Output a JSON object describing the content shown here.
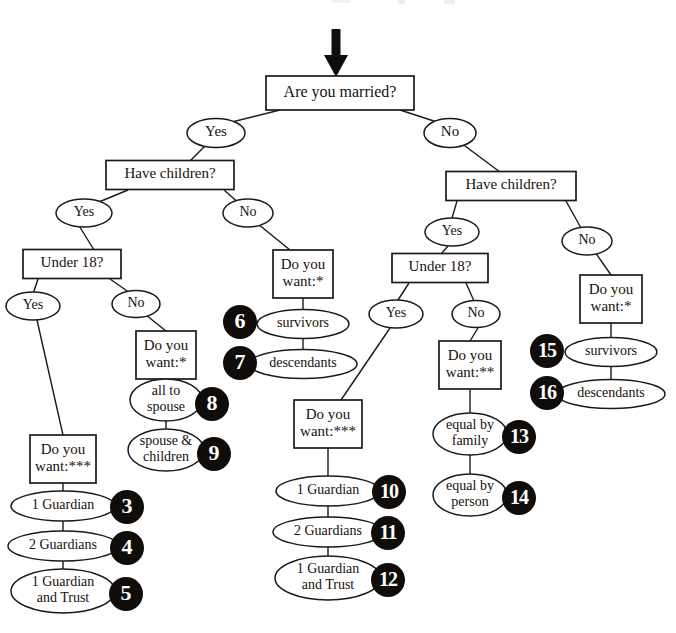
{
  "figure": {
    "type": "decision-tree-flowchart",
    "colors": {
      "line": "#1a1a1a",
      "text": "#17110d",
      "badge_fill": "#100c0a",
      "badge_text": "#ffffff",
      "node_fill": "#ffffff",
      "background": "#ffffff"
    },
    "entry_arrow": {
      "name": "entry-arrow",
      "points_to": "Are you married?"
    }
  },
  "nodes": [
    {
      "id": "root",
      "label": "Are you married?",
      "shape": "box",
      "x": 340,
      "y": 93,
      "w": 148,
      "h": 34,
      "font": 16
    },
    {
      "id": "m_yes",
      "label": "Yes",
      "shape": "ellipse",
      "x": 216,
      "y": 133,
      "w": 58,
      "h": 29,
      "font": 15
    },
    {
      "id": "m_no",
      "label": "No",
      "shape": "ellipse",
      "x": 450,
      "y": 133,
      "w": 52,
      "h": 29,
      "font": 15
    },
    {
      "id": "m_children",
      "label": "Have children?",
      "shape": "box",
      "x": 170,
      "y": 175,
      "w": 128,
      "h": 29,
      "font": 15
    },
    {
      "id": "mc_yes",
      "label": "Yes",
      "shape": "ellipse",
      "x": 84,
      "y": 213,
      "w": 56,
      "h": 28,
      "font": 14
    },
    {
      "id": "mc_no",
      "label": "No",
      "shape": "ellipse",
      "x": 248,
      "y": 213,
      "w": 50,
      "h": 28,
      "font": 14
    },
    {
      "id": "m_under18",
      "label": "Under 18?",
      "shape": "box",
      "x": 72,
      "y": 264,
      "w": 98,
      "h": 29,
      "font": 15
    },
    {
      "id": "mu_yes",
      "label": "Yes",
      "shape": "ellipse",
      "x": 33,
      "y": 306,
      "w": 54,
      "h": 28,
      "font": 14
    },
    {
      "id": "mu_no",
      "label": "No",
      "shape": "ellipse",
      "x": 136,
      "y": 304,
      "w": 48,
      "h": 27,
      "font": 14
    },
    {
      "id": "m_want1",
      "label": "Do you\nwant:*",
      "shape": "box",
      "x": 166,
      "y": 355,
      "w": 60,
      "h": 48,
      "font": 15
    },
    {
      "id": "all_to_spouse",
      "label": "all to\nspouse",
      "shape": "ellipse",
      "x": 166,
      "y": 400,
      "w": 72,
      "h": 42,
      "font": 14
    },
    {
      "id": "spouse_children",
      "label": "spouse &\nchildren",
      "shape": "ellipse",
      "x": 166,
      "y": 450,
      "w": 76,
      "h": 42,
      "font": 14
    },
    {
      "id": "m_want3",
      "label": "Do you\nwant:***",
      "shape": "box",
      "x": 63,
      "y": 459,
      "w": 66,
      "h": 48,
      "font": 15
    },
    {
      "id": "g1",
      "label": "1 Guardian",
      "shape": "ellipse",
      "x": 63,
      "y": 506,
      "w": 104,
      "h": 30,
      "font": 14
    },
    {
      "id": "g2",
      "label": "2 Guardians",
      "shape": "ellipse",
      "x": 63,
      "y": 546,
      "w": 110,
      "h": 30,
      "font": 14
    },
    {
      "id": "g3",
      "label": "1 Guardian\nand Trust",
      "shape": "ellipse",
      "x": 63,
      "y": 591,
      "w": 104,
      "h": 44,
      "font": 14
    },
    {
      "id": "nm_want1",
      "label": "Do you\nwant:*",
      "shape": "box",
      "x": 303,
      "y": 274,
      "w": 60,
      "h": 48,
      "font": 15
    },
    {
      "id": "survivors1",
      "label": "survivors",
      "shape": "ellipse",
      "x": 303,
      "y": 324,
      "w": 92,
      "h": 29,
      "font": 14
    },
    {
      "id": "descendants1",
      "label": "descendants",
      "shape": "ellipse",
      "x": 303,
      "y": 364,
      "w": 108,
      "h": 29,
      "font": 14
    },
    {
      "id": "nm_children",
      "label": "Have children?",
      "shape": "box",
      "x": 511,
      "y": 186,
      "w": 130,
      "h": 29,
      "font": 15
    },
    {
      "id": "nc_yes",
      "label": "Yes",
      "shape": "ellipse",
      "x": 452,
      "y": 232,
      "w": 54,
      "h": 28,
      "font": 14
    },
    {
      "id": "nc_no",
      "label": "No",
      "shape": "ellipse",
      "x": 587,
      "y": 241,
      "w": 50,
      "h": 28,
      "font": 14
    },
    {
      "id": "n_under18",
      "label": "Under 18?",
      "shape": "box",
      "x": 440,
      "y": 268,
      "w": 96,
      "h": 29,
      "font": 15
    },
    {
      "id": "nu_yes",
      "label": "Yes",
      "shape": "ellipse",
      "x": 396,
      "y": 314,
      "w": 54,
      "h": 28,
      "font": 14
    },
    {
      "id": "nu_no",
      "label": "No",
      "shape": "ellipse",
      "x": 476,
      "y": 314,
      "w": 48,
      "h": 27,
      "font": 14
    },
    {
      "id": "n_want2",
      "label": "Do you\nwant:**",
      "shape": "box",
      "x": 470,
      "y": 365,
      "w": 62,
      "h": 48,
      "font": 15
    },
    {
      "id": "equal_family",
      "label": "equal by\nfamily",
      "shape": "ellipse",
      "x": 470,
      "y": 434,
      "w": 74,
      "h": 42,
      "font": 14
    },
    {
      "id": "equal_person",
      "label": "equal by\nperson",
      "shape": "ellipse",
      "x": 470,
      "y": 495,
      "w": 74,
      "h": 42,
      "font": 14
    },
    {
      "id": "n_want1",
      "label": "Do you\nwant:*",
      "shape": "box",
      "x": 611,
      "y": 299,
      "w": 62,
      "h": 48,
      "font": 15
    },
    {
      "id": "survivors2",
      "label": "survivors",
      "shape": "ellipse",
      "x": 611,
      "y": 352,
      "w": 92,
      "h": 29,
      "font": 14
    },
    {
      "id": "descendants2",
      "label": "descendants",
      "shape": "ellipse",
      "x": 611,
      "y": 394,
      "w": 108,
      "h": 29,
      "font": 14
    },
    {
      "id": "n_want3",
      "label": "Do you\nwant:***",
      "shape": "box",
      "x": 328,
      "y": 424,
      "w": 68,
      "h": 48,
      "font": 15
    },
    {
      "id": "g4",
      "label": "1 Guardian",
      "shape": "ellipse",
      "x": 328,
      "y": 491,
      "w": 104,
      "h": 30,
      "font": 14
    },
    {
      "id": "g5",
      "label": "2 Guardians",
      "shape": "ellipse",
      "x": 328,
      "y": 532,
      "w": 110,
      "h": 30,
      "font": 14
    },
    {
      "id": "g6",
      "label": "1 Guardian\nand Trust",
      "shape": "ellipse",
      "x": 328,
      "y": 578,
      "w": 106,
      "h": 44,
      "font": 14
    }
  ],
  "edges": [
    {
      "from": "root",
      "to": "m_yes",
      "x1": 280,
      "y1": 110,
      "x2": 224,
      "y2": 124
    },
    {
      "from": "root",
      "to": "m_no",
      "x1": 400,
      "y1": 110,
      "x2": 443,
      "y2": 124
    },
    {
      "from": "m_yes",
      "to": "m_children",
      "x1": 208,
      "y1": 143,
      "x2": 190,
      "y2": 161
    },
    {
      "from": "m_children",
      "to": "mc_yes",
      "x1": 128,
      "y1": 190,
      "x2": 94,
      "y2": 204
    },
    {
      "from": "m_children",
      "to": "mc_no",
      "x1": 224,
      "y1": 190,
      "x2": 240,
      "y2": 204
    },
    {
      "from": "mc_yes",
      "to": "m_under18",
      "x1": 78,
      "y1": 224,
      "x2": 94,
      "y2": 250
    },
    {
      "from": "m_under18",
      "to": "mu_yes",
      "x1": 38,
      "y1": 279,
      "x2": 33,
      "y2": 294
    },
    {
      "from": "m_under18",
      "to": "mu_no",
      "x1": 110,
      "y1": 279,
      "x2": 130,
      "y2": 293
    },
    {
      "from": "mu_no",
      "to": "m_want1",
      "x1": 146,
      "y1": 315,
      "x2": 166,
      "y2": 331
    },
    {
      "from": "m_want1",
      "to": "all_to_spouse",
      "x1": 166,
      "y1": 379,
      "x2": 166,
      "y2": 380
    },
    {
      "from": "all_to_spouse",
      "to": "spouse_children",
      "x1": 166,
      "y1": 421,
      "x2": 166,
      "y2": 429
    },
    {
      "from": "mu_yes",
      "to": "m_want3",
      "x1": 37,
      "y1": 320,
      "x2": 63,
      "y2": 435
    },
    {
      "from": "m_want3",
      "to": "g1",
      "x1": 63,
      "y1": 483,
      "x2": 63,
      "y2": 491
    },
    {
      "from": "g1",
      "to": "g2",
      "x1": 63,
      "y1": 521,
      "x2": 63,
      "y2": 531
    },
    {
      "from": "g2",
      "to": "g3",
      "x1": 63,
      "y1": 561,
      "x2": 63,
      "y2": 569
    },
    {
      "from": "mc_no",
      "to": "nm_want1",
      "x1": 258,
      "y1": 224,
      "x2": 290,
      "y2": 250
    },
    {
      "from": "nm_want1",
      "to": "survivors1",
      "x1": 303,
      "y1": 298,
      "x2": 303,
      "y2": 310
    },
    {
      "from": "survivors1",
      "to": "descendants1",
      "x1": 303,
      "y1": 338,
      "x2": 303,
      "y2": 350
    },
    {
      "from": "m_no",
      "to": "nm_children",
      "x1": 461,
      "y1": 143,
      "x2": 500,
      "y2": 172
    },
    {
      "from": "nm_children",
      "to": "nc_yes",
      "x1": 457,
      "y1": 201,
      "x2": 452,
      "y2": 218
    },
    {
      "from": "nm_children",
      "to": "nc_no",
      "x1": 566,
      "y1": 201,
      "x2": 581,
      "y2": 228
    },
    {
      "from": "nc_yes",
      "to": "n_under18",
      "x1": 448,
      "y1": 246,
      "x2": 441,
      "y2": 254
    },
    {
      "from": "n_under18",
      "to": "nu_yes",
      "x1": 409,
      "y1": 283,
      "x2": 398,
      "y2": 300
    },
    {
      "from": "n_under18",
      "to": "nu_no",
      "x1": 466,
      "y1": 283,
      "x2": 474,
      "y2": 301
    },
    {
      "from": "nu_no",
      "to": "n_want2",
      "x1": 478,
      "y1": 328,
      "x2": 470,
      "y2": 341
    },
    {
      "from": "n_want2",
      "to": "equal_family",
      "x1": 470,
      "y1": 389,
      "x2": 470,
      "y2": 413
    },
    {
      "from": "equal_family",
      "to": "equal_person",
      "x1": 470,
      "y1": 455,
      "x2": 470,
      "y2": 474
    },
    {
      "from": "nu_yes",
      "to": "n_want3",
      "x1": 390,
      "y1": 328,
      "x2": 341,
      "y2": 400
    },
    {
      "from": "n_want3",
      "to": "g4",
      "x1": 328,
      "y1": 448,
      "x2": 328,
      "y2": 476
    },
    {
      "from": "g4",
      "to": "g5",
      "x1": 328,
      "y1": 506,
      "x2": 328,
      "y2": 517
    },
    {
      "from": "g5",
      "to": "g6",
      "x1": 328,
      "y1": 547,
      "x2": 328,
      "y2": 556
    },
    {
      "from": "nc_no",
      "to": "n_want1",
      "x1": 595,
      "y1": 252,
      "x2": 611,
      "y2": 275
    },
    {
      "from": "n_want1",
      "to": "survivors2",
      "x1": 611,
      "y1": 323,
      "x2": 611,
      "y2": 338
    },
    {
      "from": "survivors2",
      "to": "descendants2",
      "x1": 611,
      "y1": 366,
      "x2": 611,
      "y2": 380
    }
  ],
  "badges": [
    {
      "number": "6",
      "attached_to": "survivors",
      "side": "left",
      "x": 240,
      "y": 322,
      "r": 17
    },
    {
      "number": "7",
      "attached_to": "descendants",
      "side": "left",
      "x": 240,
      "y": 363,
      "r": 17
    },
    {
      "number": "8",
      "attached_to": "all to spouse",
      "side": "right",
      "x": 212,
      "y": 404,
      "r": 17
    },
    {
      "number": "9",
      "attached_to": "spouse & children",
      "side": "right",
      "x": 214,
      "y": 454,
      "r": 17
    },
    {
      "number": "3",
      "attached_to": "1 Guardian",
      "side": "right",
      "x": 127,
      "y": 507,
      "r": 17
    },
    {
      "number": "4",
      "attached_to": "2 Guardians",
      "side": "right",
      "x": 127,
      "y": 548,
      "r": 17
    },
    {
      "number": "5",
      "attached_to": "1 Guardian and Trust",
      "side": "right",
      "x": 126,
      "y": 594,
      "r": 17
    },
    {
      "number": "10",
      "attached_to": "1 Guardian",
      "side": "right",
      "x": 389,
      "y": 492,
      "r": 17
    },
    {
      "number": "11",
      "attached_to": "2 Guardians",
      "side": "right",
      "x": 388,
      "y": 533,
      "r": 17
    },
    {
      "number": "12",
      "attached_to": "1 Guardian and Trust",
      "side": "right",
      "x": 388,
      "y": 580,
      "r": 17
    },
    {
      "number": "13",
      "attached_to": "equal by family",
      "side": "right",
      "x": 519,
      "y": 437,
      "r": 17
    },
    {
      "number": "14",
      "attached_to": "equal by person",
      "side": "right",
      "x": 519,
      "y": 498,
      "r": 17
    },
    {
      "number": "15",
      "attached_to": "survivors",
      "side": "left",
      "x": 547,
      "y": 351,
      "r": 17
    },
    {
      "number": "16",
      "attached_to": "descendants",
      "side": "left",
      "x": 547,
      "y": 393,
      "r": 17
    }
  ]
}
